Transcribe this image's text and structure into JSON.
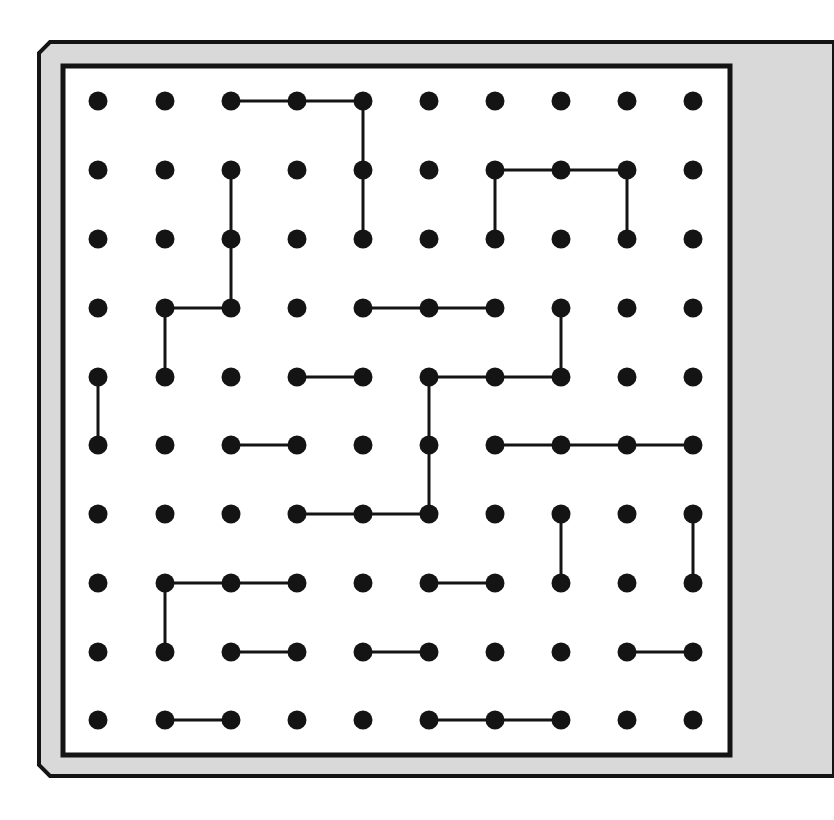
{
  "puzzle": {
    "type": "dot-grid-line-puzzle",
    "rows": 10,
    "cols": 10,
    "colors": {
      "background": "#ffffff",
      "frame_fill": "#d9d9d9",
      "frame_stroke": "#141414",
      "board_fill": "#ffffff",
      "dot": "#141414",
      "line": "#141414"
    },
    "col_x": [
      98,
      165,
      231,
      297,
      363,
      429,
      495,
      561,
      627,
      693
    ],
    "row_y": [
      101,
      170,
      239,
      308,
      377,
      445,
      514,
      583,
      652,
      720
    ],
    "segments": [
      [
        [
          0,
          2
        ],
        [
          0,
          3
        ]
      ],
      [
        [
          0,
          3
        ],
        [
          0,
          4
        ]
      ],
      [
        [
          0,
          4
        ],
        [
          1,
          4
        ]
      ],
      [
        [
          1,
          4
        ],
        [
          2,
          4
        ]
      ],
      [
        [
          1,
          2
        ],
        [
          2,
          2
        ]
      ],
      [
        [
          2,
          2
        ],
        [
          3,
          2
        ]
      ],
      [
        [
          3,
          1
        ],
        [
          3,
          2
        ]
      ],
      [
        [
          3,
          1
        ],
        [
          4,
          1
        ]
      ],
      [
        [
          1,
          6
        ],
        [
          1,
          7
        ]
      ],
      [
        [
          1,
          7
        ],
        [
          1,
          8
        ]
      ],
      [
        [
          1,
          6
        ],
        [
          2,
          6
        ]
      ],
      [
        [
          1,
          8
        ],
        [
          2,
          8
        ]
      ],
      [
        [
          3,
          4
        ],
        [
          3,
          5
        ]
      ],
      [
        [
          3,
          5
        ],
        [
          3,
          6
        ]
      ],
      [
        [
          3,
          7
        ],
        [
          4,
          7
        ]
      ],
      [
        [
          4,
          5
        ],
        [
          4,
          6
        ]
      ],
      [
        [
          4,
          6
        ],
        [
          4,
          7
        ]
      ],
      [
        [
          4,
          5
        ],
        [
          5,
          5
        ]
      ],
      [
        [
          5,
          5
        ],
        [
          6,
          5
        ]
      ],
      [
        [
          4,
          3
        ],
        [
          4,
          4
        ]
      ],
      [
        [
          4,
          0
        ],
        [
          5,
          0
        ]
      ],
      [
        [
          5,
          2
        ],
        [
          5,
          3
        ]
      ],
      [
        [
          5,
          6
        ],
        [
          5,
          7
        ]
      ],
      [
        [
          5,
          7
        ],
        [
          5,
          8
        ]
      ],
      [
        [
          5,
          8
        ],
        [
          5,
          9
        ]
      ],
      [
        [
          6,
          3
        ],
        [
          6,
          4
        ]
      ],
      [
        [
          6,
          4
        ],
        [
          6,
          5
        ]
      ],
      [
        [
          6,
          7
        ],
        [
          7,
          7
        ]
      ],
      [
        [
          6,
          9
        ],
        [
          7,
          9
        ]
      ],
      [
        [
          7,
          1
        ],
        [
          7,
          2
        ]
      ],
      [
        [
          7,
          2
        ],
        [
          7,
          3
        ]
      ],
      [
        [
          7,
          1
        ],
        [
          8,
          1
        ]
      ],
      [
        [
          7,
          5
        ],
        [
          7,
          6
        ]
      ],
      [
        [
          8,
          2
        ],
        [
          8,
          3
        ]
      ],
      [
        [
          8,
          4
        ],
        [
          8,
          5
        ]
      ],
      [
        [
          8,
          8
        ],
        [
          8,
          9
        ]
      ],
      [
        [
          9,
          1
        ],
        [
          9,
          2
        ]
      ],
      [
        [
          9,
          5
        ],
        [
          9,
          6
        ]
      ],
      [
        [
          9,
          6
        ],
        [
          9,
          7
        ]
      ]
    ]
  }
}
